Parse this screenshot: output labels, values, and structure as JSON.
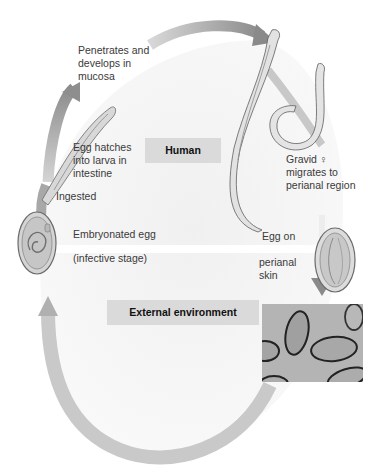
{
  "diagram": {
    "sections": {
      "human": "Human",
      "external": "External environment"
    },
    "stages": {
      "penetrates": [
        "Penetrates and",
        "develops in",
        "mucosa"
      ],
      "hatches": [
        "Egg hatches",
        "into larva in",
        "intestine"
      ],
      "ingested": "Ingested",
      "embryonated": "Embryonated egg",
      "infective": "(infective stage)",
      "gravid": [
        "Gravid ♀",
        "migrates to",
        "perianal region"
      ],
      "egg_on": "Egg on",
      "perianal_skin": [
        "perianal",
        "skin"
      ]
    },
    "colors": {
      "background": "#ffffff",
      "arrow": "#9a9a9a",
      "arrow_light": "#d2d2d2",
      "band": "#dadada",
      "inner_fill": "#eeeeee",
      "text": "#3a3a3a"
    }
  }
}
